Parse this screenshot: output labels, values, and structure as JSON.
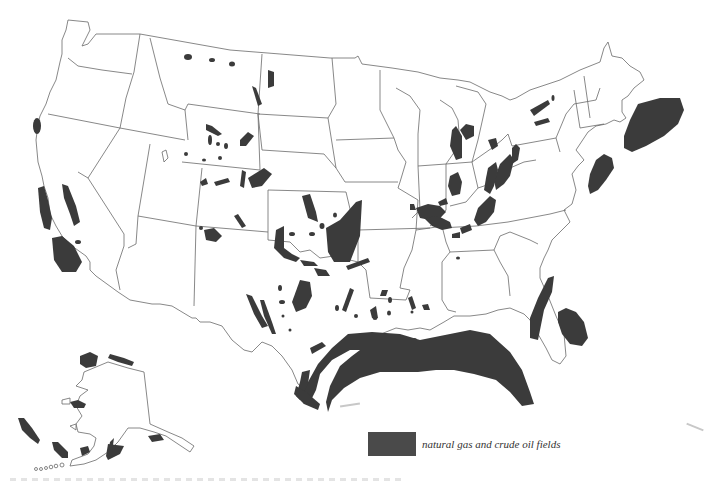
{
  "map": {
    "title": "",
    "region": "United States (contiguous states and Alaska)",
    "field_color": "#3b3b3b",
    "border_color": "#6a6a6a",
    "background": "#ffffff"
  },
  "legend": {
    "items": [
      {
        "label": "natural gas and crude oil fields",
        "swatch_color": "#4a4a4a",
        "icon": "filled-rectangle-swatch"
      }
    ]
  },
  "fields": {
    "regions": [
      "California (coastal & offshore)",
      "Gulf of Mexico (Texas/Louisiana offshore)",
      "Atlantic offshore (New England)",
      "Atlantic offshore (Mid-Atlantic)",
      "Atlantic offshore (Southeast)",
      "Appalachian basin",
      "Illinois basin",
      "Michigan basin",
      "Mid-Continent (Kansas/Oklahoma)",
      "Permian basin (West Texas)",
      "Rocky Mountains (Wyoming/Colorado)",
      "Williston basin (Montana/North Dakota)",
      "Alaska (North Slope, Cook Inlet, offshore)"
    ]
  }
}
